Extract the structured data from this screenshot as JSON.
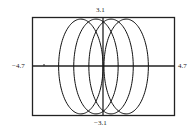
{
  "chart_data": {
    "type": "line",
    "title": "",
    "xlabel": "",
    "ylabel": "",
    "xlim": [
      -4.7,
      4.7
    ],
    "ylim": [
      -3.1,
      3.1
    ],
    "grid": false,
    "legend": null,
    "tick_labels": {
      "x_min": "−4.7",
      "x_max": "4.7",
      "y_max": "3.1",
      "y_min": "−3.1"
    },
    "series": [
      {
        "name": "parametric curve (loops)",
        "description": "Four overlapping elliptical loops of a parametric curve, each ~3 units tall (half-height) and ~1.5 units half-width, centered near x = -1.5, -0.5, 0.5, 1.5",
        "loop_centers_x": [
          -1.5,
          -0.5,
          0.5,
          1.5
        ],
        "half_width": 1.47,
        "half_height": 3.0
      }
    ],
    "x_axis_crossings": [
      -2.95,
      -1.95,
      -0.95,
      0.0,
      0.95,
      1.9,
      2.95,
      3.8
    ]
  },
  "colors": {
    "line": "#111111",
    "frame": "#222222",
    "background": "#ffffff"
  }
}
